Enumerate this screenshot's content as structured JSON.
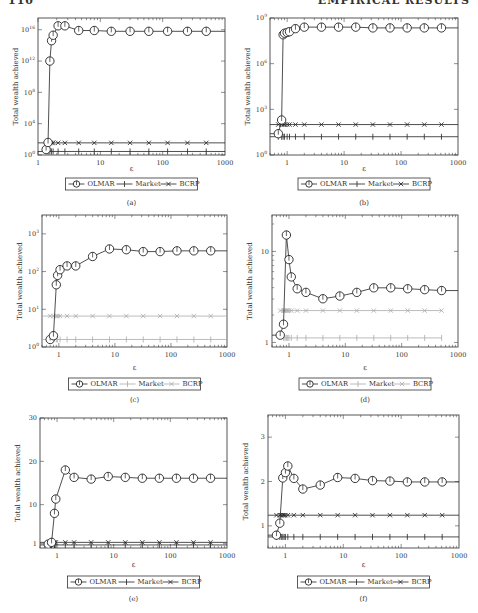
{
  "page_header": {
    "left": "110",
    "right": "EMPIRICAL RESULTS"
  },
  "legend_labels": [
    "OLMAR",
    "Market",
    "BCRP"
  ],
  "chart_data": [
    {
      "id": "a",
      "caption": "(a)",
      "type": "line",
      "xlabel": "ε",
      "ylabel": "Total wealth achieved",
      "xscale": "log",
      "yscale": "log",
      "xlim": [
        1,
        1000
      ],
      "ylim_exp": [
        0,
        17.5
      ],
      "xticks": [
        1,
        10,
        100,
        1000
      ],
      "xtick_labels": [
        "1",
        "10",
        "100",
        "1000"
      ],
      "yticks": [
        0,
        4,
        8,
        12,
        16
      ],
      "ytick_labels": [
        "10^0",
        "10^4",
        "10^8",
        "10^12",
        "10^16"
      ],
      "frame": {
        "x": 38,
        "y": 18,
        "w": 187,
        "h": 137
      },
      "legend_y": 184,
      "caption_y": 205,
      "xlabel_y": 171,
      "legend_style": "normal",
      "series": [
        {
          "name": "OLMAR",
          "marker": "circle",
          "color": "#222222",
          "x": [
            1.35,
            1.45,
            1.55,
            1.65,
            1.75,
            2.1,
            2.7,
            4.5,
            8,
            15,
            30,
            60,
            120,
            250,
            500,
            1000
          ],
          "y_exp": [
            0.7,
            1.6,
            12.0,
            14.6,
            15.3,
            16.5,
            16.5,
            15.9,
            15.9,
            15.8,
            15.8,
            15.8,
            15.8,
            15.8,
            15.8,
            15.8
          ]
        },
        {
          "name": "Market",
          "marker": "plus",
          "color": "#222222",
          "x": [
            1,
            1.45,
            1.55,
            1.65,
            1.75,
            2.1,
            2.7,
            4.5,
            8,
            15,
            30,
            60,
            120,
            250,
            500,
            1000
          ],
          "y_exp": [
            0.45,
            0.45,
            0.45,
            0.45,
            0.45,
            0.45,
            0.45,
            0.45,
            0.45,
            0.45,
            0.45,
            0.45,
            0.45,
            0.45,
            0.45,
            0.45
          ]
        },
        {
          "name": "BCRP",
          "marker": "x",
          "color": "#222222",
          "x": [
            1,
            1.45,
            1.55,
            1.65,
            1.75,
            2.1,
            2.7,
            4.5,
            8,
            15,
            30,
            60,
            120,
            250,
            500,
            1000
          ],
          "y_exp": [
            1.55,
            1.55,
            1.55,
            1.55,
            1.55,
            1.55,
            1.55,
            1.55,
            1.55,
            1.55,
            1.55,
            1.55,
            1.55,
            1.55,
            1.55,
            1.55
          ]
        }
      ]
    },
    {
      "id": "b",
      "caption": "(b)",
      "type": "line",
      "xlabel": "ε",
      "ylabel": "Total wealth achieved",
      "xscale": "log",
      "yscale": "log",
      "xlim": [
        0.5,
        1000
      ],
      "ylim_exp": [
        0,
        9
      ],
      "xticks": [
        1,
        10,
        100,
        1000
      ],
      "xtick_labels": [
        "1",
        "10",
        "100",
        "1000"
      ],
      "yticks": [
        0,
        3,
        6,
        9
      ],
      "ytick_labels": [
        "10^0",
        "10^3",
        "10^6",
        "10^9"
      ],
      "frame": {
        "x": 270,
        "y": 18,
        "w": 188,
        "h": 137
      },
      "legend_y": 184,
      "caption_y": 205,
      "xlabel_y": 171,
      "legend_style": "normal",
      "series": [
        {
          "name": "OLMAR",
          "marker": "circle",
          "color": "#222222",
          "x": [
            0.5,
            0.7,
            0.8,
            0.85,
            0.9,
            1,
            1.1,
            1.4,
            2,
            4,
            8,
            16,
            32,
            64,
            128,
            256,
            512,
            1000
          ],
          "y_exp": [
            1.4,
            1.4,
            2.3,
            7.9,
            8.0,
            8.05,
            8.1,
            8.3,
            8.4,
            8.4,
            8.4,
            8.4,
            8.35,
            8.35,
            8.35,
            8.35,
            8.35,
            8.35
          ]
        },
        {
          "name": "Market",
          "marker": "plus",
          "color": "#222222",
          "x": [
            0.5,
            0.7,
            0.8,
            0.85,
            0.9,
            1,
            1.1,
            1.4,
            2,
            4,
            8,
            16,
            32,
            64,
            128,
            256,
            512,
            1000
          ],
          "y_exp": [
            1.2,
            1.2,
            1.2,
            1.2,
            1.2,
            1.2,
            1.2,
            1.2,
            1.2,
            1.2,
            1.2,
            1.2,
            1.2,
            1.2,
            1.2,
            1.2,
            1.2,
            1.2
          ]
        },
        {
          "name": "BCRP",
          "marker": "x",
          "color": "#222222",
          "x": [
            0.5,
            0.7,
            0.8,
            0.85,
            0.9,
            1,
            1.1,
            1.4,
            2,
            4,
            8,
            16,
            32,
            64,
            128,
            256,
            512,
            1000
          ],
          "y_exp": [
            2.0,
            2.0,
            2.0,
            2.0,
            2.0,
            2.0,
            2.0,
            2.0,
            2.0,
            2.0,
            2.0,
            2.0,
            2.0,
            2.0,
            2.0,
            2.0,
            2.0,
            2.0
          ]
        }
      ]
    },
    {
      "id": "c",
      "caption": "(c)",
      "type": "line",
      "xlabel": "ε",
      "ylabel": "Total wealth achieved",
      "xscale": "log",
      "yscale": "log",
      "xlim": [
        0.5,
        1000
      ],
      "ylim_exp": [
        0,
        3.5
      ],
      "xticks": [
        1,
        10,
        100,
        1000
      ],
      "xtick_labels": [
        "1",
        "10",
        "100",
        "1000"
      ],
      "yticks": [
        0,
        1,
        2,
        3
      ],
      "ytick_labels": [
        "10^0",
        "10^1",
        "10^2",
        "10^3"
      ],
      "frame": {
        "x": 42,
        "y": 215,
        "w": 185,
        "h": 132
      },
      "legend_y": 384,
      "caption_y": 402,
      "xlabel_y": 370,
      "legend_style": "normal",
      "series": [
        {
          "name": "OLMAR",
          "marker": "circle",
          "color": "#222222",
          "x": [
            0.7,
            0.8,
            0.9,
            0.95,
            1.05,
            1.4,
            2,
            4,
            8,
            16,
            32,
            64,
            128,
            256,
            512,
            1000
          ],
          "y_exp": [
            0.2,
            0.3,
            1.65,
            1.9,
            2.05,
            2.15,
            2.15,
            2.4,
            2.6,
            2.58,
            2.53,
            2.53,
            2.55,
            2.55,
            2.55,
            2.55
          ]
        },
        {
          "name": "Market",
          "marker": "plus",
          "color": "#aaaaaa",
          "x": [
            0.5,
            0.7,
            0.8,
            0.9,
            0.95,
            1.05,
            1.4,
            2,
            4,
            8,
            16,
            32,
            64,
            128,
            256,
            512,
            1000
          ],
          "y_exp": [
            0.2,
            0.2,
            0.2,
            0.2,
            0.2,
            0.2,
            0.2,
            0.2,
            0.2,
            0.2,
            0.2,
            0.2,
            0.2,
            0.2,
            0.2,
            0.2,
            0.2
          ]
        },
        {
          "name": "BCRP",
          "marker": "x",
          "color": "#aaaaaa",
          "x": [
            0.5,
            0.7,
            0.8,
            0.9,
            0.95,
            1.05,
            1.4,
            2,
            4,
            8,
            16,
            32,
            64,
            128,
            256,
            512,
            1000
          ],
          "y_exp": [
            0.82,
            0.82,
            0.82,
            0.82,
            0.82,
            0.82,
            0.82,
            0.82,
            0.82,
            0.82,
            0.82,
            0.82,
            0.82,
            0.82,
            0.82,
            0.82,
            0.82
          ]
        }
      ]
    },
    {
      "id": "d",
      "caption": "(d)",
      "type": "line",
      "xlabel": "ε",
      "ylabel": "Total wealth achieved",
      "xscale": "log",
      "yscale": "log",
      "xlim": [
        0.5,
        1000
      ],
      "ylim_exp": [
        -0.05,
        1.4
      ],
      "xticks": [
        1,
        10,
        100,
        1000
      ],
      "xtick_labels": [
        "1",
        "10",
        "100",
        "1000"
      ],
      "yticks": [
        0,
        1
      ],
      "ytick_labels": [
        "1",
        "10"
      ],
      "frame": {
        "x": 272,
        "y": 215,
        "w": 186,
        "h": 132
      },
      "legend_y": 384,
      "caption_y": 402,
      "xlabel_y": 370,
      "legend_style": "grey",
      "series": [
        {
          "name": "OLMAR",
          "marker": "circle",
          "color": "#222222",
          "x": [
            0.5,
            0.7,
            0.8,
            0.9,
            1.0,
            1.1,
            1.4,
            2,
            4,
            8,
            16,
            32,
            64,
            128,
            256,
            512,
            1000
          ],
          "y_exp": [
            0.08,
            0.08,
            0.2,
            1.18,
            0.91,
            0.72,
            0.59,
            0.55,
            0.48,
            0.51,
            0.55,
            0.6,
            0.6,
            0.59,
            0.58,
            0.57,
            0.57
          ]
        },
        {
          "name": "Market",
          "marker": "plus",
          "color": "#aaaaaa",
          "x": [
            0.8,
            0.85,
            0.9,
            0.95,
            1.0,
            1.1,
            1.4,
            2,
            4,
            8,
            16,
            32,
            64,
            128,
            256,
            512
          ],
          "y_exp": [
            0.05,
            0.05,
            0.05,
            0.05,
            0.05,
            0.05,
            0.05,
            0.05,
            0.05,
            0.05,
            0.05,
            0.05,
            0.05,
            0.05,
            0.05,
            0.05
          ]
        },
        {
          "name": "BCRP",
          "marker": "x",
          "color": "#aaaaaa",
          "x": [
            0.7,
            0.8,
            0.85,
            0.9,
            0.95,
            1.0,
            1.1,
            1.4,
            2,
            4,
            8,
            16,
            32,
            64,
            128,
            256,
            512
          ],
          "y_exp": [
            0.35,
            0.35,
            0.35,
            0.35,
            0.35,
            0.35,
            0.35,
            0.35,
            0.35,
            0.35,
            0.35,
            0.35,
            0.35,
            0.35,
            0.35,
            0.35,
            0.35
          ]
        }
      ]
    },
    {
      "id": "e",
      "caption": "(e)",
      "type": "line",
      "xlabel": "ε",
      "ylabel": "Total wealth achieved",
      "xscale": "log",
      "yscale": "linear",
      "xlim": [
        0.5,
        1000
      ],
      "ylim": [
        0,
        30
      ],
      "xticks": [
        1,
        10,
        100,
        1000
      ],
      "xtick_labels": [
        "1",
        "10",
        "100",
        "1000"
      ],
      "yticks": [
        1,
        10,
        20,
        30
      ],
      "ytick_labels": [
        "1",
        "10",
        "20",
        "30"
      ],
      "frame": {
        "x": 40,
        "y": 418,
        "w": 187,
        "h": 130
      },
      "legend_y": 582,
      "caption_y": 601,
      "xlabel_y": 567,
      "legend_style": "normal",
      "series": [
        {
          "name": "OLMAR",
          "marker": "circle",
          "color": "#222222",
          "x": [
            0.7,
            0.8,
            0.9,
            0.95,
            1.4,
            2,
            4,
            8,
            16,
            32,
            64,
            128,
            256,
            512,
            1000
          ],
          "y": [
            0.9,
            1.3,
            8.0,
            11.3,
            18.0,
            16.3,
            15.9,
            16.5,
            16.3,
            16.1,
            16.1,
            16.1,
            16.1,
            16.1,
            16.1
          ]
        },
        {
          "name": "Market",
          "marker": "plus",
          "color": "#222222",
          "x": [
            0.5,
            0.7,
            0.8,
            0.9,
            0.95,
            1.4,
            2,
            4,
            8,
            16,
            32,
            64,
            128,
            256,
            512,
            1000
          ],
          "y": [
            0.7,
            0.7,
            0.7,
            0.7,
            0.7,
            0.7,
            0.7,
            0.7,
            0.7,
            0.7,
            0.7,
            0.7,
            0.7,
            0.7,
            0.7,
            0.7
          ]
        },
        {
          "name": "BCRP",
          "marker": "x",
          "color": "#222222",
          "x": [
            0.5,
            0.7,
            0.8,
            0.9,
            0.95,
            1.4,
            2,
            4,
            8,
            16,
            32,
            64,
            128,
            256,
            512,
            1000
          ],
          "y": [
            1.3,
            1.3,
            1.3,
            1.3,
            1.3,
            1.3,
            1.3,
            1.3,
            1.3,
            1.3,
            1.3,
            1.3,
            1.3,
            1.3,
            1.3,
            1.3
          ]
        }
      ]
    },
    {
      "id": "f",
      "caption": "(f)",
      "type": "line",
      "xlabel": "ε",
      "ylabel": "Total wealth achieved",
      "xscale": "log",
      "yscale": "linear",
      "xlim": [
        0.5,
        1000
      ],
      "ylim": [
        0.5,
        3.5
      ],
      "xticks": [
        1,
        10,
        100,
        1000
      ],
      "xtick_labels": [
        "1",
        "10",
        "100",
        "1000"
      ],
      "yticks": [
        1,
        2,
        3
      ],
      "ytick_labels": [
        "1",
        "2",
        "3"
      ],
      "frame": {
        "x": 268,
        "y": 415,
        "w": 191,
        "h": 133
      },
      "legend_y": 582,
      "caption_y": 601,
      "xlabel_y": 567,
      "legend_style": "normal",
      "series": [
        {
          "name": "OLMAR",
          "marker": "circle",
          "color": "#222222",
          "x": [
            0.5,
            0.7,
            0.8,
            0.9,
            1.0,
            1.1,
            1.4,
            2,
            4,
            8,
            16,
            32,
            64,
            128,
            256,
            512,
            1000
          ],
          "y": [
            0.79,
            0.79,
            1.06,
            2.08,
            2.2,
            2.35,
            2.07,
            1.83,
            1.92,
            2.09,
            2.07,
            2.02,
            2.01,
            1.99,
            1.99,
            1.99,
            1.99
          ]
        },
        {
          "name": "Market",
          "marker": "plus",
          "color": "#222222",
          "x": [
            0.5,
            0.7,
            0.8,
            0.85,
            0.9,
            0.95,
            1.0,
            1.1,
            1.4,
            2,
            4,
            8,
            16,
            32,
            64,
            128,
            256,
            512,
            1000
          ],
          "y": [
            0.75,
            0.75,
            0.75,
            0.75,
            0.75,
            0.75,
            0.75,
            0.75,
            0.75,
            0.75,
            0.75,
            0.75,
            0.75,
            0.75,
            0.75,
            0.75,
            0.75,
            0.75,
            0.75
          ]
        },
        {
          "name": "BCRP",
          "marker": "x",
          "color": "#222222",
          "x": [
            0.5,
            0.7,
            0.8,
            0.85,
            0.9,
            0.95,
            1.0,
            1.1,
            1.4,
            2,
            4,
            8,
            16,
            32,
            64,
            128,
            256,
            512,
            1000
          ],
          "y": [
            1.24,
            1.24,
            1.24,
            1.24,
            1.24,
            1.24,
            1.24,
            1.24,
            1.24,
            1.24,
            1.24,
            1.24,
            1.24,
            1.24,
            1.24,
            1.24,
            1.24,
            1.24,
            1.24
          ]
        }
      ]
    }
  ]
}
